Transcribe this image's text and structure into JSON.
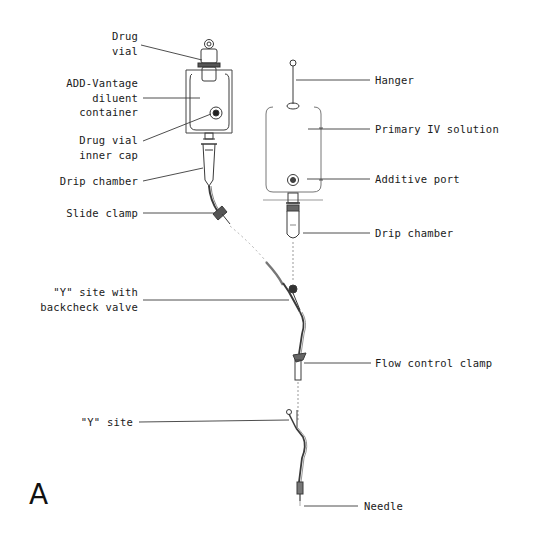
{
  "figure": {
    "panel_letter": "A",
    "left_labels": {
      "drug_vial": "Drug\nvial",
      "diluent_container": "ADD-Vantage\ndiluent\ncontainer",
      "inner_cap": "Drug vial\ninner cap",
      "drip_chamber_secondary": "Drip chamber",
      "slide_clamp": "Slide clamp",
      "y_site_backcheck": "\"Y\" site with\nbackcheck valve",
      "y_site": "\"Y\" site"
    },
    "right_labels": {
      "hanger": "Hanger",
      "primary_iv": "Primary IV solution",
      "additive_port": "Additive port",
      "drip_chamber_primary": "Drip chamber",
      "flow_control_clamp": "Flow control clamp",
      "needle": "Needle"
    },
    "colors": {
      "line": "#3a3a3a",
      "light_line": "#9a9a9a",
      "text": "#1a1a1a",
      "background": "#ffffff"
    }
  }
}
